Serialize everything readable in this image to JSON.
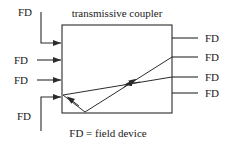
{
  "figure": {
    "title": "transmissive coupler",
    "caption": "FD = field device",
    "stroke_color": "#2b2b2b",
    "text_color": "#1a1a1a",
    "background_color": "#ffffff"
  },
  "coupler": {
    "label": "transmissive coupler",
    "box": {
      "x": 62,
      "y": 25,
      "width": 110,
      "height": 88
    }
  },
  "inputs": {
    "side": "left",
    "items": [
      {
        "label": "FD",
        "index": 1,
        "routing": "elbow",
        "arrow": "right"
      },
      {
        "label": "FD",
        "index": 2,
        "routing": "straight",
        "arrow": "right"
      },
      {
        "label": "FD",
        "index": 3,
        "routing": "straight",
        "arrow": "right"
      },
      {
        "label": "FD",
        "index": 4,
        "routing": "elbow",
        "arrow": "right"
      }
    ]
  },
  "outputs": {
    "side": "right",
    "items": [
      {
        "label": "FD",
        "index": 1,
        "routing": "straight"
      },
      {
        "label": "FD",
        "index": 2,
        "routing": "straight"
      },
      {
        "label": "FD",
        "index": 3,
        "routing": "straight"
      },
      {
        "label": "FD",
        "index": 4,
        "routing": "straight"
      }
    ]
  },
  "light_path": {
    "description": "internal v-shaped reflective light path",
    "segments": [
      {
        "name": "upward-diagonal",
        "arrow": "up-right"
      },
      {
        "name": "downward-diagonal",
        "arrow": "down-left"
      },
      {
        "name": "input-reflect",
        "arrow": "down-left"
      }
    ]
  }
}
